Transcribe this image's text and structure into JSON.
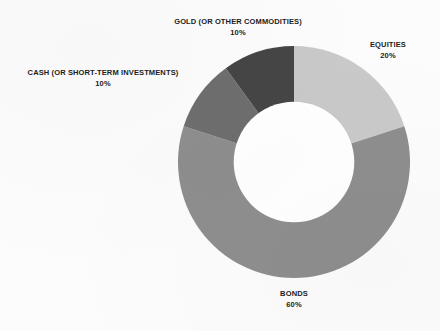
{
  "chart_data": {
    "type": "pie",
    "variant": "donut",
    "title": "",
    "subtitle": "",
    "xlabel": "",
    "ylabel": "",
    "legend_position": "none",
    "labels_outside": true,
    "start_angle_deg": 0,
    "direction": "clockwise",
    "hole_ratio": 0.52,
    "categories": [
      "EQUITIES",
      "BONDS",
      "CASH (OR SHORT-TERM INVESTMENTS)",
      "GOLD (OR OTHER COMMODITIES)"
    ],
    "values": [
      20,
      60,
      10,
      10
    ],
    "value_labels": [
      "20%",
      "60%",
      "10%",
      "10%"
    ],
    "colors": [
      "#c9c9c9",
      "#8e8e8e",
      "#6e6e6e",
      "#454545"
    ],
    "slices": [
      {
        "name": "EQUITIES",
        "value": 20,
        "value_label": "20%",
        "color": "#c9c9c9"
      },
      {
        "name": "BONDS",
        "value": 60,
        "value_label": "60%",
        "color": "#8e8e8e"
      },
      {
        "name": "CASH (OR SHORT-TERM INVESTMENTS)",
        "value": 10,
        "value_label": "10%",
        "color": "#6e6e6e"
      },
      {
        "name": "GOLD (OR OTHER COMMODITIES)",
        "value": 10,
        "value_label": "10%",
        "color": "#454545"
      }
    ]
  },
  "labels": {
    "gold": {
      "name": "GOLD (OR OTHER COMMODITIES)",
      "pct": "10%"
    },
    "equities": {
      "name": "EQUITIES",
      "pct": "20%"
    },
    "cash": {
      "name": "CASH (OR SHORT-TERM INVESTMENTS)",
      "pct": "10%"
    },
    "bonds": {
      "name": "BONDS",
      "pct": "60%"
    }
  },
  "style": {
    "background": "#fcfcfc",
    "text_color": "#1c1c1c",
    "hole_color": "#ffffff"
  }
}
